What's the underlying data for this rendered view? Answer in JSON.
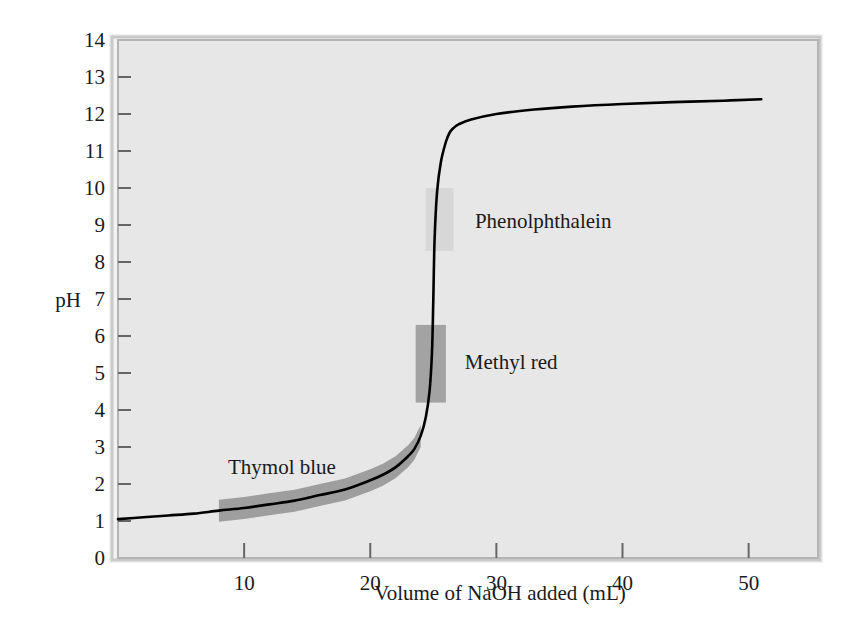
{
  "chart_data": {
    "type": "line",
    "title": "",
    "xlabel": "Volume of NaOH added (mL)",
    "ylabel": "pH",
    "xlim": [
      0,
      55.5
    ],
    "ylim": [
      0,
      14
    ],
    "grid": false,
    "legend": "none",
    "x_ticks": [
      10,
      20,
      30,
      40,
      50
    ],
    "y_ticks": [
      0,
      1,
      2,
      3,
      4,
      5,
      6,
      7,
      8,
      9,
      10,
      11,
      12,
      13,
      14
    ],
    "series": [
      {
        "name": "Titration curve",
        "color": "#000000",
        "x": [
          0,
          2,
          4,
          6,
          8,
          10,
          12,
          14,
          16,
          18,
          20,
          21,
          22,
          23,
          23.5,
          24,
          24.4,
          24.7,
          24.9,
          25,
          25.1,
          25.3,
          25.6,
          26,
          26.3,
          26.6,
          27,
          28,
          30,
          33,
          36,
          40,
          44,
          48,
          51
        ],
        "y": [
          1.05,
          1.1,
          1.15,
          1.2,
          1.28,
          1.35,
          1.45,
          1.55,
          1.7,
          1.85,
          2.1,
          2.25,
          2.45,
          2.75,
          2.95,
          3.3,
          3.8,
          4.5,
          5.6,
          7.0,
          8.6,
          9.9,
          10.7,
          11.25,
          11.5,
          11.62,
          11.72,
          11.85,
          12.0,
          12.12,
          12.2,
          12.27,
          12.32,
          12.36,
          12.4
        ]
      }
    ],
    "annotations": [
      {
        "name": "phenolphthalein",
        "label": "Phenolphthalein",
        "shape": "vertical-band",
        "ph_range": [
          8.3,
          10.0
        ],
        "volume_range": [
          24.4,
          26.6
        ],
        "color": "#d7d7d7",
        "label_volume": 28.3,
        "label_ph": 9.1
      },
      {
        "name": "methyl-red",
        "label": "Methyl red",
        "shape": "vertical-band",
        "ph_range": [
          4.2,
          6.3
        ],
        "volume_range": [
          23.6,
          26.0
        ],
        "color": "#a3a3a3",
        "label_volume": 27.5,
        "label_ph": 5.3
      },
      {
        "name": "thymol-blue",
        "label": "Thymol blue",
        "shape": "curved-band",
        "ph_range": [
          1.2,
          2.8
        ],
        "volume_range": [
          7.0,
          24.0
        ],
        "color": "#9e9e9e",
        "label_volume": 13.0,
        "label_ph": 2.45
      }
    ],
    "colors": {
      "curve": "#000000",
      "plot_background": "#e7e7e7",
      "frame": "#b4b4b4",
      "page_background": "#ffffff",
      "text": "#1a1a1a"
    }
  }
}
